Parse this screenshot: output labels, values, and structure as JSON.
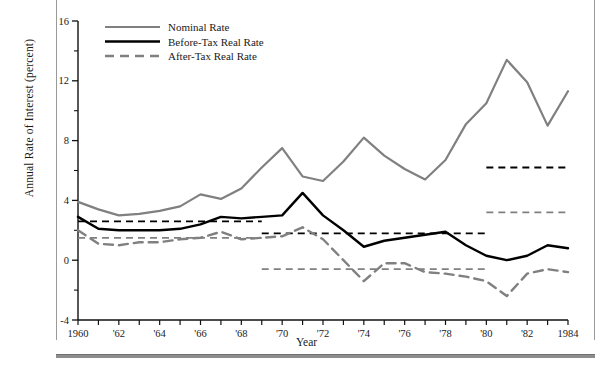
{
  "chart_data": {
    "type": "line",
    "title": "",
    "xlabel": "Year",
    "ylabel": "Annual Rate of Interest (percent)",
    "xlim": [
      1960,
      1984
    ],
    "ylim": [
      -4,
      16
    ],
    "yticks": [
      -4,
      0,
      4,
      8,
      12,
      16
    ],
    "yticks_minor": [
      -2,
      2,
      6,
      10,
      14
    ],
    "ytick_labels": [
      "-4",
      "0",
      "4",
      "8",
      "12",
      "16"
    ],
    "xticks": [
      1960,
      1961,
      1962,
      1963,
      1964,
      1965,
      1966,
      1967,
      1968,
      1969,
      1970,
      1971,
      1972,
      1973,
      1974,
      1975,
      1976,
      1977,
      1978,
      1979,
      1980,
      1981,
      1982,
      1983,
      1984
    ],
    "xtick_labels": [
      "1960",
      "",
      "'62",
      "",
      "'64",
      "",
      "'66",
      "",
      "'68",
      "",
      "'70",
      "",
      "'72",
      "",
      "'74",
      "",
      "'76",
      "",
      "'78",
      "",
      "'80",
      "",
      "'82",
      "",
      "1984"
    ],
    "grid": false,
    "legend_position": "top-left",
    "x": [
      1960,
      1961,
      1962,
      1963,
      1964,
      1965,
      1966,
      1967,
      1968,
      1969,
      1970,
      1971,
      1972,
      1973,
      1974,
      1975,
      1976,
      1977,
      1978,
      1979,
      1980,
      1981,
      1982,
      1983,
      1984
    ],
    "series": [
      {
        "name": "Nominal Rate",
        "style": "solid",
        "color": "#808080",
        "width": 2.2,
        "values": [
          3.9,
          3.4,
          3.0,
          3.1,
          3.3,
          3.6,
          4.4,
          4.1,
          4.8,
          6.2,
          7.5,
          5.6,
          5.3,
          6.6,
          8.2,
          7.0,
          6.1,
          5.4,
          6.7,
          9.1,
          10.5,
          13.4,
          11.9,
          9.0,
          11.3
        ]
      },
      {
        "name": "Before-Tax Real Rate",
        "style": "solid",
        "color": "#000000",
        "width": 2.4,
        "values": [
          2.9,
          2.1,
          2.0,
          2.0,
          2.0,
          2.1,
          2.4,
          2.9,
          2.8,
          2.9,
          3.0,
          4.5,
          3.0,
          2.0,
          0.9,
          1.3,
          1.5,
          1.7,
          1.9,
          1.0,
          0.3,
          0.0,
          0.3,
          1.0,
          0.8
        ]
      },
      {
        "name": "After-Tax Real Rate",
        "style": "dashed",
        "color": "#808080",
        "width": 2.4,
        "values": [
          2.0,
          1.1,
          1.0,
          1.2,
          1.2,
          1.4,
          1.5,
          1.9,
          1.4,
          1.5,
          1.6,
          2.2,
          1.4,
          0.0,
          -1.4,
          -0.2,
          -0.2,
          -0.8,
          -0.9,
          -1.1,
          -1.4,
          -2.4,
          -0.9,
          -0.6,
          -0.8
        ]
      }
    ],
    "reference_lines": [
      {
        "series": "Before-Tax Real Rate",
        "value": 2.6,
        "x_start": 1960,
        "x_end": 1969,
        "color": "#000000",
        "style": "dashed"
      },
      {
        "series": "After-Tax Real Rate",
        "value": 1.5,
        "x_start": 1960,
        "x_end": 1969,
        "color": "#808080",
        "style": "dashed"
      },
      {
        "series": "Before-Tax Real Rate",
        "value": 1.8,
        "x_start": 1969,
        "x_end": 1980,
        "color": "#000000",
        "style": "dashed"
      },
      {
        "series": "After-Tax Real Rate",
        "value": -0.6,
        "x_start": 1969,
        "x_end": 1980,
        "color": "#808080",
        "style": "dashed"
      },
      {
        "series": "Before-Tax Real Rate",
        "value": 6.2,
        "x_start": 1980,
        "x_end": 1984,
        "color": "#000000",
        "style": "dashed"
      },
      {
        "series": "After-Tax Real Rate",
        "value": 3.2,
        "x_start": 1980,
        "x_end": 1984,
        "color": "#808080",
        "style": "dashed"
      }
    ],
    "annotations": []
  },
  "legend": {
    "entries": [
      {
        "label": "Nominal Rate"
      },
      {
        "label": "Before-Tax Real Rate"
      },
      {
        "label": "After-Tax Real Rate"
      }
    ]
  }
}
